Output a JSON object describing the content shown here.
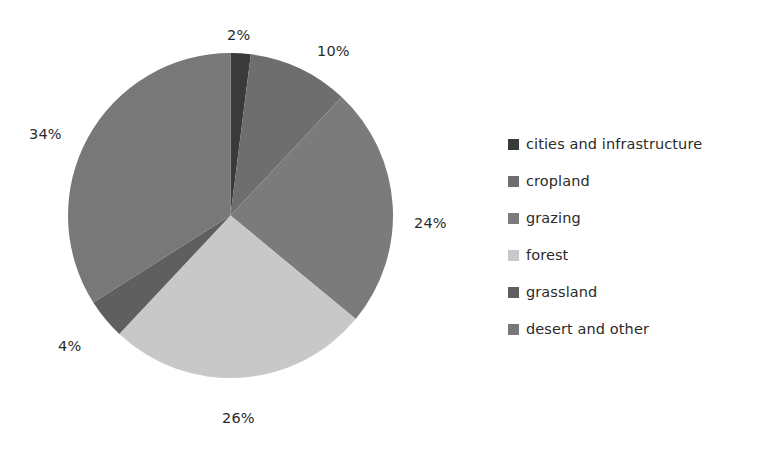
{
  "chart_data": {
    "type": "pie",
    "title": "",
    "categories": [
      "cities and infrastructure",
      "cropland",
      "grazing",
      "forest",
      "grassland",
      "desert and other"
    ],
    "values": [
      2,
      10,
      24,
      26,
      4,
      34
    ],
    "value_labels": [
      "2%",
      "10%",
      "24%",
      "26%",
      "4%",
      "34%"
    ],
    "colors": [
      "#3a3a3a",
      "#6e6e6e",
      "#7b7b7b",
      "#c8c8c8",
      "#5f5f5f",
      "#787878"
    ],
    "units": "percent",
    "start_angle_deg": 0,
    "direction": "clockwise",
    "legend_position": "right",
    "grid": false,
    "xlabel": "",
    "ylabel": ""
  },
  "pie": {
    "slices": [
      {
        "label": "cities and infrastructure",
        "value": 2,
        "display": "2%",
        "color": "#3a3a3a"
      },
      {
        "label": "cropland",
        "value": 10,
        "display": "10%",
        "color": "#6e6e6e"
      },
      {
        "label": "grazing",
        "value": 24,
        "display": "24%",
        "color": "#7b7b7b"
      },
      {
        "label": "forest",
        "value": 26,
        "display": "26%",
        "color": "#c8c8c8"
      },
      {
        "label": "grassland",
        "value": 4,
        "display": "4%",
        "color": "#5f5f5f"
      },
      {
        "label": "desert and other",
        "value": 34,
        "display": "34%",
        "color": "#787878"
      }
    ]
  },
  "labels": {
    "cities": "2%",
    "cropland": "10%",
    "grazing": "24%",
    "forest": "26%",
    "grassland": "4%",
    "desert": "34%"
  },
  "legend": {
    "items": [
      {
        "label": "cities and infrastructure",
        "color": "#3a3a3a"
      },
      {
        "label": "cropland",
        "color": "#6e6e6e"
      },
      {
        "label": "grazing",
        "color": "#7b7b7b"
      },
      {
        "label": "forest",
        "color": "#c8c8c8"
      },
      {
        "label": "grassland",
        "color": "#5f5f5f"
      },
      {
        "label": "desert and other",
        "color": "#787878"
      }
    ]
  }
}
